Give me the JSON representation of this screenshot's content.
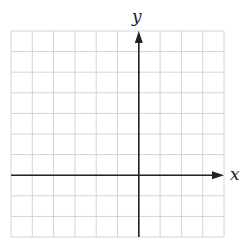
{
  "diagram": {
    "type": "coordinate-plane",
    "grid": {
      "columns": 10,
      "rows": 10,
      "x_min": -6,
      "x_max": 4,
      "y_min": -3,
      "y_max": 7,
      "left_px": 11,
      "top_px": 31,
      "cell_w_px": 21.3,
      "cell_h_px": 20.6,
      "line_color": "#d4d4d4",
      "axis_color": "#222222"
    },
    "axes": {
      "x_label": "x",
      "y_label": "y"
    }
  }
}
